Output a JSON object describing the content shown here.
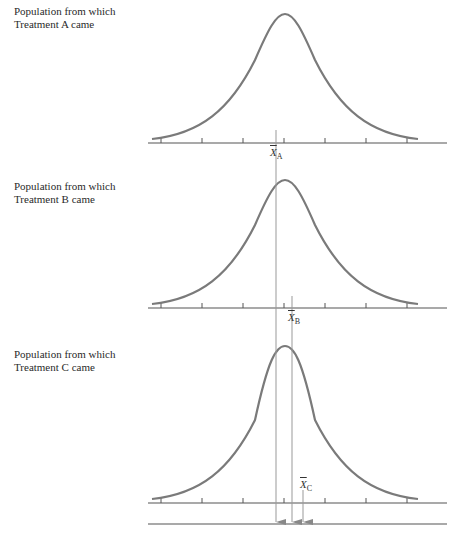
{
  "panels": [
    {
      "line1": "Population from which",
      "line2": "Treatment A came",
      "mean_symbol": "X",
      "mean_sub": "A"
    },
    {
      "line1": "Population from which",
      "line2": "Treatment B came",
      "mean_symbol": "X",
      "mean_sub": "B"
    },
    {
      "line1": "Population from which",
      "line2": "Treatment C came",
      "mean_symbol": "X",
      "mean_sub": "C"
    }
  ],
  "colors": {
    "curve": "#7a7a7a",
    "axis": "#555555",
    "mean_line": "#999999"
  }
}
